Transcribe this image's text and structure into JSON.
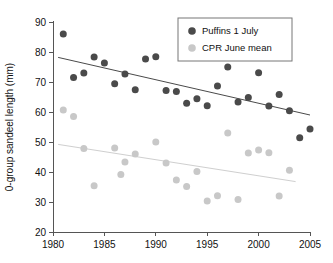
{
  "chart_data": {
    "type": "scatter",
    "title": "",
    "xlabel": "",
    "ylabel": "0-group sandeel length (mm)",
    "xlim": [
      1980,
      2005
    ],
    "ylim": [
      20,
      90
    ],
    "grid": false,
    "legend_position": "top-right",
    "xticks": [
      "1980",
      "1985",
      "1990",
      "1995",
      "2000",
      "2005"
    ],
    "xtick_values": [
      1980,
      1985,
      1990,
      1995,
      2000,
      2005
    ],
    "yticks": [
      "20",
      "30",
      "40",
      "50",
      "60",
      "70",
      "80",
      "90"
    ],
    "ytick_values": [
      20,
      30,
      40,
      50,
      60,
      70,
      80,
      90
    ],
    "series": [
      {
        "name": "Puffins 1 July",
        "color": "#4a4a4a",
        "marker": "circle",
        "marker_size": 7,
        "points": [
          [
            1981,
            86.0
          ],
          [
            1982,
            71.5
          ],
          [
            1983,
            73.0
          ],
          [
            1984,
            78.3
          ],
          [
            1985,
            76.3
          ],
          [
            1986,
            69.4
          ],
          [
            1987,
            72.7
          ],
          [
            1988,
            67.4
          ],
          [
            1989,
            77.7
          ],
          [
            1990,
            78.4
          ],
          [
            1991,
            67.2
          ],
          [
            1992,
            66.8
          ],
          [
            1993,
            62.9
          ],
          [
            1994,
            64.4
          ],
          [
            1995,
            62.1
          ],
          [
            1996,
            68.7
          ],
          [
            1997,
            75.0
          ],
          [
            1998,
            63.3
          ],
          [
            1999,
            64.8
          ],
          [
            2000,
            73.1
          ],
          [
            2001,
            62.0
          ],
          [
            2002,
            65.8
          ],
          [
            2003,
            60.4
          ],
          [
            2004,
            51.4
          ],
          [
            2005,
            54.3
          ]
        ],
        "trendline": {
          "x0": 1980.5,
          "y0": 78.2,
          "x1": 2005.0,
          "y1": 59.0
        }
      },
      {
        "name": "CPR June mean",
        "color": "#c8c8c8",
        "marker": "circle",
        "marker_size": 7,
        "points": [
          [
            1981,
            60.7
          ],
          [
            1982,
            58.5
          ],
          [
            1983,
            47.8
          ],
          [
            1984,
            35.4
          ],
          [
            1986,
            48.0
          ],
          [
            1986.6,
            39.2
          ],
          [
            1987,
            43.3
          ],
          [
            1988,
            46.0
          ],
          [
            1990,
            50.0
          ],
          [
            1991,
            43.0
          ],
          [
            1992,
            37.3
          ],
          [
            1993,
            35.2
          ],
          [
            1994,
            40.2
          ],
          [
            1995,
            30.3
          ],
          [
            1996,
            32.1
          ],
          [
            1997,
            53.0
          ],
          [
            1998,
            30.8
          ],
          [
            1999,
            46.3
          ],
          [
            2000,
            47.3
          ],
          [
            2001,
            46.4
          ],
          [
            2002,
            32.0
          ],
          [
            2003,
            40.6
          ]
        ],
        "trendline": {
          "x0": 1980.5,
          "y0": 49.2,
          "x1": 2003.6,
          "y1": 36.8
        }
      }
    ]
  },
  "legend": {
    "entries": [
      {
        "label": "Puffins 1 July",
        "color": "#4a4a4a"
      },
      {
        "label": "CPR June mean",
        "color": "#c8c8c8"
      }
    ]
  }
}
